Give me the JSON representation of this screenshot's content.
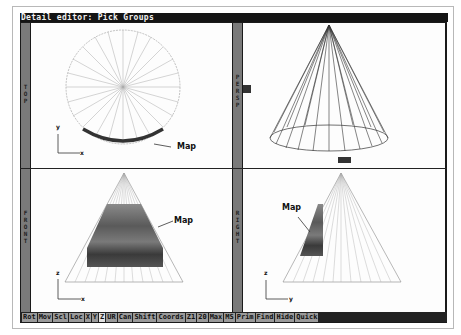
{
  "window": {
    "title": "Detail editor: Pick Groups"
  },
  "views": {
    "top": {
      "label": "TOP",
      "annotation": "Map",
      "axis_v": "y",
      "axis_h": "x"
    },
    "persp": {
      "label": "PERSP"
    },
    "front": {
      "label": "FRONT",
      "annotation": "Map",
      "axis_v": "z",
      "axis_h": "x"
    },
    "right": {
      "label": "RIGHT",
      "annotation": "Map",
      "axis_v": "z",
      "axis_h": "y"
    }
  },
  "menubar": {
    "items": [
      {
        "label": "Rot"
      },
      {
        "label": "Mov"
      },
      {
        "label": "Scl"
      },
      {
        "label": "Loc"
      },
      {
        "label": "X"
      },
      {
        "label": "Y"
      },
      {
        "label": "Z"
      },
      {
        "label": "UR"
      },
      {
        "label": "Can"
      },
      {
        "label": "Shift"
      },
      {
        "label": "Coords"
      },
      {
        "label": "Z1"
      },
      {
        "label": "20"
      },
      {
        "label": "Max"
      },
      {
        "label": "MS"
      },
      {
        "label": "Prim"
      },
      {
        "label": "Find"
      },
      {
        "label": "Hide"
      },
      {
        "label": "Quick"
      }
    ],
    "active_index": 6
  },
  "colors": {
    "frame": "#1a1a1a",
    "viewport": "#fdfdfd",
    "strip": "#7a7a7a",
    "menu_button": "#9a9a9a",
    "selection": "#333333"
  }
}
